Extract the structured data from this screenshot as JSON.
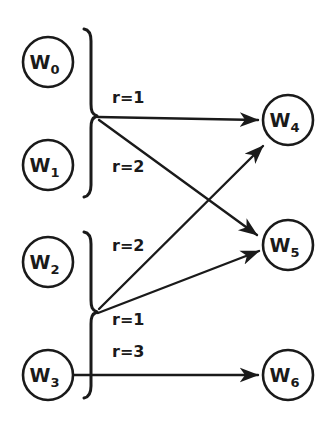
{
  "diagram": {
    "background_color": "#ffffff",
    "ink_color": "#1a1a1a",
    "nodes": [
      {
        "id": "w0",
        "base": "W",
        "subscript": "0",
        "cx": 48,
        "cy": 62,
        "r": 25,
        "side": "left"
      },
      {
        "id": "w1",
        "base": "W",
        "subscript": "1",
        "cx": 48,
        "cy": 165,
        "r": 25,
        "side": "left"
      },
      {
        "id": "w2",
        "base": "W",
        "subscript": "2",
        "cx": 48,
        "cy": 262,
        "r": 25,
        "side": "left"
      },
      {
        "id": "w3",
        "base": "W",
        "subscript": "3",
        "cx": 48,
        "cy": 375,
        "r": 25,
        "side": "left"
      },
      {
        "id": "w4",
        "base": "W",
        "subscript": "4",
        "cx": 288,
        "cy": 120,
        "r": 25,
        "side": "right"
      },
      {
        "id": "w5",
        "base": "W",
        "subscript": "5",
        "cx": 288,
        "cy": 245,
        "r": 25,
        "side": "right"
      },
      {
        "id": "w6",
        "base": "W",
        "subscript": "6",
        "cx": 288,
        "cy": 375,
        "r": 25,
        "side": "right"
      }
    ],
    "braces": [
      {
        "id": "brace-top",
        "groups": [
          "w0",
          "w1"
        ],
        "x": 82,
        "y_top": 28,
        "y_bottom": 197,
        "apex_x": 97,
        "apex_y": 116
      },
      {
        "id": "brace-bottom",
        "groups": [
          "w2",
          "w3"
        ],
        "x": 82,
        "y_top": 231,
        "y_bottom": 398,
        "apex_x": 97,
        "apex_y": 312
      }
    ],
    "edges": [
      {
        "id": "edge-top-w4",
        "from": "brace-top",
        "to": "w4",
        "label": "r=1",
        "label_x": 112,
        "label_y": 103,
        "x1": 98,
        "y1": 117,
        "x2": 261,
        "y2": 120
      },
      {
        "id": "edge-top-w5",
        "from": "brace-top",
        "to": "w5",
        "label": "r=2",
        "label_x": 112,
        "label_y": 172,
        "x1": 99,
        "y1": 120,
        "x2": 261,
        "y2": 238
      },
      {
        "id": "edge-bottom-w4",
        "from": "brace-bottom",
        "to": "w4",
        "label": "r=2",
        "label_x": 112,
        "label_y": 251,
        "x1": 99,
        "y1": 309,
        "x2": 266,
        "y2": 143
      },
      {
        "id": "edge-bottom-w5",
        "from": "brace-bottom",
        "to": "w5",
        "label": "r=1",
        "label_x": 112,
        "label_y": 325,
        "x1": 98,
        "y1": 313,
        "x2": 262,
        "y2": 253
      },
      {
        "id": "edge-w3-w6",
        "from": "w3",
        "to": "w6",
        "label": "r=3",
        "label_x": 112,
        "label_y": 357,
        "x1": 73,
        "y1": 375,
        "x2": 261,
        "y2": 375
      }
    ]
  }
}
